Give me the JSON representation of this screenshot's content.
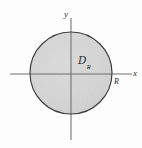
{
  "figure": {
    "type": "math-diagram",
    "background_color": "#fdfdfd"
  },
  "axes": {
    "x_axis": {
      "label": "x",
      "orientation": "horizontal",
      "start_x": 10,
      "end_x": 132,
      "y": 74,
      "color": "#6b6b6b"
    },
    "y_axis": {
      "label": "y",
      "orientation": "vertical",
      "start_y": 18,
      "end_y": 140,
      "x": 71,
      "color": "#6b6b6b"
    }
  },
  "disk": {
    "center_x": 71,
    "center_y": 73,
    "radius": 41,
    "fill_color": "#d6d6d6",
    "stroke_color": "#3d3d3d",
    "stroke_width": 1.1
  },
  "labels": {
    "region": {
      "symbol": "D",
      "subscript": "R",
      "full_text": "D_R"
    },
    "radius_mark": "R",
    "x_axis_label": "x",
    "y_axis_label": "y"
  }
}
